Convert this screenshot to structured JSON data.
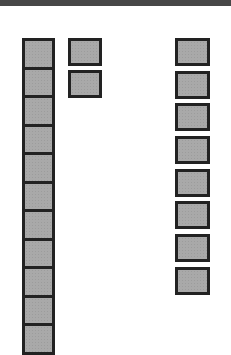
{
  "header": {
    "color": "#474747"
  },
  "grid": {
    "cell_fill": "#a9a9a9",
    "cell_border": "#222222",
    "columns": [
      {
        "name": "left",
        "count": 10
      },
      {
        "name": "middle",
        "count": 2
      },
      {
        "name": "right",
        "count": 8
      }
    ]
  }
}
